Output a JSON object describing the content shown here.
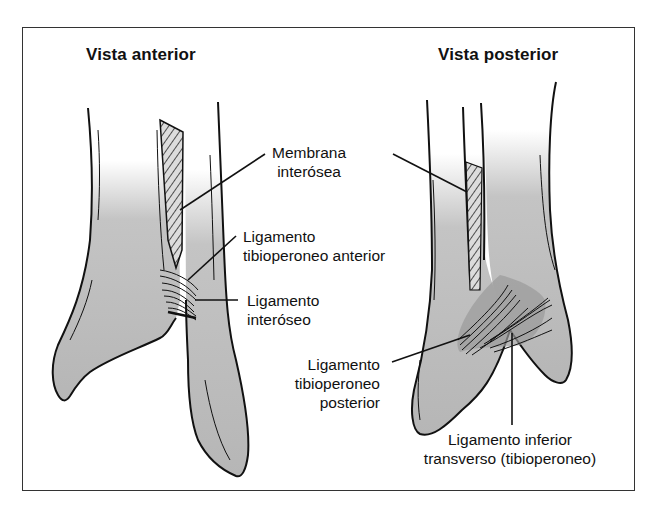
{
  "figure": {
    "type": "anatomical-diagram",
    "colors": {
      "bone_fill": "#b8b8b8",
      "outline": "#111111",
      "frame": "#333333",
      "background": "#ffffff",
      "ligament_shadow": "#9a9a9a"
    }
  },
  "views": [
    {
      "id": "anterior",
      "title": "Vista anterior"
    },
    {
      "id": "posterior",
      "title": "Vista posterior"
    }
  ],
  "labels": {
    "membrana": {
      "line1": "Membrana",
      "line2": "interósea"
    },
    "lig_tib_anterior": {
      "line1": "Ligamento",
      "line2": "tibioperoneo anterior"
    },
    "lig_interoseo": {
      "line1": "Ligamento",
      "line2": "interóseo"
    },
    "lig_tib_posterior": {
      "line1": "Ligamento",
      "line2": "tibioperoneo",
      "line3": "posterior"
    },
    "lig_inferior_transverso": {
      "line1": "Ligamento inferior",
      "line2": "transverso (tibioperoneo)"
    }
  }
}
